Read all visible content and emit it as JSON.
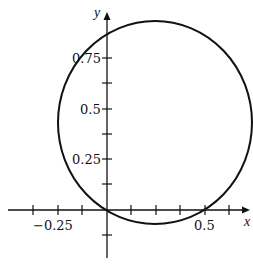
{
  "diagram": {
    "type": "polar-curve-plot",
    "axes": {
      "x_label": "x",
      "y_label": "y",
      "x_ticks": [
        {
          "value": -0.25,
          "label": "−0.25"
        },
        {
          "value": 0.5,
          "label": "0.5"
        }
      ],
      "y_ticks": [
        {
          "value": 0.25,
          "label": "0.25"
        },
        {
          "value": 0.5,
          "label": "0.5"
        },
        {
          "value": 0.75,
          "label": "0.75"
        }
      ],
      "tick_step": 0.125
    },
    "curve": {
      "shape": "circle",
      "passes_through": [
        [
          0,
          0
        ],
        [
          0.5,
          0
        ]
      ],
      "approx_center": [
        0.25,
        0.45
      ],
      "approx_radius": 0.5
    },
    "colors": {
      "stroke": "#111111",
      "background": "#ffffff"
    }
  }
}
